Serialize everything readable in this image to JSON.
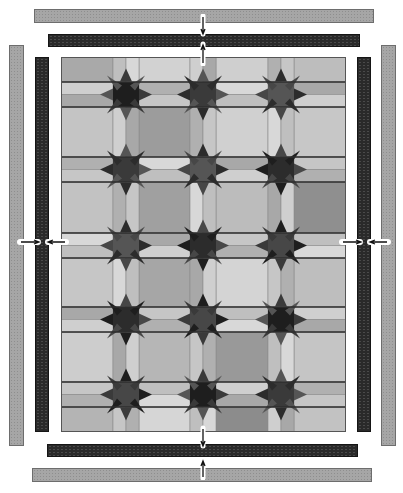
{
  "diagram": {
    "title": "",
    "colors": {
      "outer_border": "#a6a6a6",
      "inner_border": "#2a2a2a",
      "background": "#ffffff"
    },
    "components": {
      "outer_border_top": {
        "label": ""
      },
      "inner_border_top": {
        "label": ""
      },
      "outer_border_left": {
        "label": ""
      },
      "inner_border_left": {
        "label": ""
      },
      "outer_border_right": {
        "label": ""
      },
      "inner_border_right": {
        "label": ""
      },
      "inner_border_bottom": {
        "label": ""
      },
      "outer_border_bottom": {
        "label": ""
      },
      "quilt_center": {
        "label": "",
        "block_columns": 4,
        "block_rows": 6
      }
    },
    "squares": [
      [
        "#a9a9a9",
        "#d2d2d2",
        "#cfcfcf",
        "#bdbdbd"
      ],
      [
        "#c4c4c4",
        "#9c9c9c",
        "#d0d0d0",
        "#c7c7c7"
      ],
      [
        "#c2c2c2",
        "#a0a0a0",
        "#bcbcbc",
        "#8f8f8f"
      ],
      [
        "#c6c6c6",
        "#a6a6a6",
        "#d4d4d4",
        "#bebebe"
      ],
      [
        "#cdcdcd",
        "#b6b6b6",
        "#999999",
        "#c5c5c5"
      ],
      [
        "#b4b4b4",
        "#d6d6d6",
        "#8c8c8c",
        "#c2c2c2"
      ]
    ]
  }
}
